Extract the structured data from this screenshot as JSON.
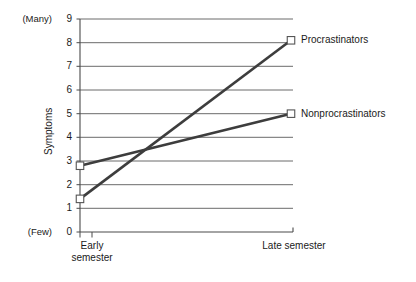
{
  "chart_data": {
    "type": "line",
    "title": "",
    "xlabel": "",
    "ylabel": "Symptoms",
    "categories": [
      "Early semester",
      "Late semester"
    ],
    "x": [
      0,
      1
    ],
    "ylim": [
      0,
      9
    ],
    "yticks": [
      0,
      1,
      2,
      3,
      4,
      5,
      6,
      7,
      8,
      9
    ],
    "ytick_labels": [
      "0",
      "1",
      "2",
      "3",
      "4",
      "5",
      "6",
      "7",
      "8",
      "9"
    ],
    "y_axis_low_annotation": "(Few)",
    "y_axis_high_annotation": "(Many)",
    "grid": true,
    "grid_orientation": "horizontal",
    "legend_position": "right-of-endpoint",
    "marker": "open-square",
    "series": [
      {
        "name": "Procrastinators",
        "values": [
          1.4,
          8.1
        ],
        "color": "#3d3d3d"
      },
      {
        "name": "Nonprocrastinators",
        "values": [
          2.8,
          5.0
        ],
        "color": "#3d3d3d"
      }
    ],
    "annotations": {
      "crossing_point_approx_y": 3.5
    }
  },
  "axis": {
    "y_ticks": [
      {
        "label": "9",
        "value": 9
      },
      {
        "label": "8",
        "value": 8
      },
      {
        "label": "7",
        "value": 7
      },
      {
        "label": "6",
        "value": 6
      },
      {
        "label": "5",
        "value": 5
      },
      {
        "label": "4",
        "value": 4
      },
      {
        "label": "3",
        "value": 3
      },
      {
        "label": "2",
        "value": 2
      },
      {
        "label": "1",
        "value": 1
      },
      {
        "label": "0",
        "value": 0
      }
    ],
    "y_title": "Symptoms",
    "many_label": "(Many)",
    "few_label": "(Few)",
    "x_categories": [
      {
        "line1": "Early",
        "line2": "semester"
      },
      {
        "line1": "Late semester",
        "line2": ""
      }
    ]
  },
  "legend": {
    "procrastinators_label": "Procrastinators",
    "nonprocrastinators_label": "Nonprocrastinators"
  },
  "style": {
    "grid_color": "#5a5a5a",
    "axis_color": "#4a4a4a",
    "line_color": "#3d3d3d",
    "marker_fill": "#ffffff",
    "marker_stroke": "#555555",
    "background": "#ffffff"
  }
}
